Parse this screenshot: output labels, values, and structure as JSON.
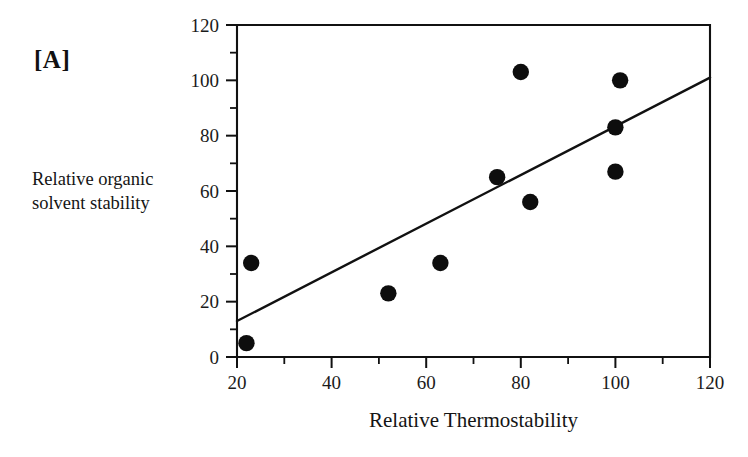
{
  "figure": {
    "panel_label": "[A]",
    "background_color": "#ffffff",
    "ink_color": "#111111"
  },
  "chart_data": {
    "type": "scatter",
    "title": "",
    "panel": "[A]",
    "xlabel": "Relative Thermostability",
    "ylabel": "Relative organic solvent stability",
    "ylabel_line1": "Relative organic",
    "ylabel_line2": "solvent stability",
    "xlim": [
      20,
      120
    ],
    "ylim": [
      0,
      120
    ],
    "x_ticks_major": [
      20,
      40,
      60,
      80,
      100,
      120
    ],
    "x_ticks_minor": [
      30,
      50,
      70,
      90,
      110
    ],
    "y_ticks_major": [
      0,
      20,
      40,
      60,
      80,
      100,
      120
    ],
    "y_ticks_minor": [
      10,
      30,
      50,
      70,
      90,
      110
    ],
    "x_tick_labels": [
      "20",
      "40",
      "60",
      "80",
      "100",
      "120"
    ],
    "y_tick_labels": [
      "0",
      "20",
      "40",
      "60",
      "80",
      "100",
      "120"
    ],
    "grid": false,
    "legend": false,
    "marker": "filled-circle",
    "marker_color": "#0d0d0d",
    "points": [
      {
        "x": 22,
        "y": 5
      },
      {
        "x": 23,
        "y": 34
      },
      {
        "x": 52,
        "y": 23
      },
      {
        "x": 63,
        "y": 34
      },
      {
        "x": 75,
        "y": 65
      },
      {
        "x": 80,
        "y": 103
      },
      {
        "x": 82,
        "y": 56
      },
      {
        "x": 100,
        "y": 83
      },
      {
        "x": 100,
        "y": 67
      },
      {
        "x": 101,
        "y": 100
      }
    ],
    "trend_line": {
      "type": "linear-fit",
      "x_start": 20,
      "y_start": 13,
      "x_end": 120,
      "y_end": 101,
      "color": "#111111"
    }
  }
}
